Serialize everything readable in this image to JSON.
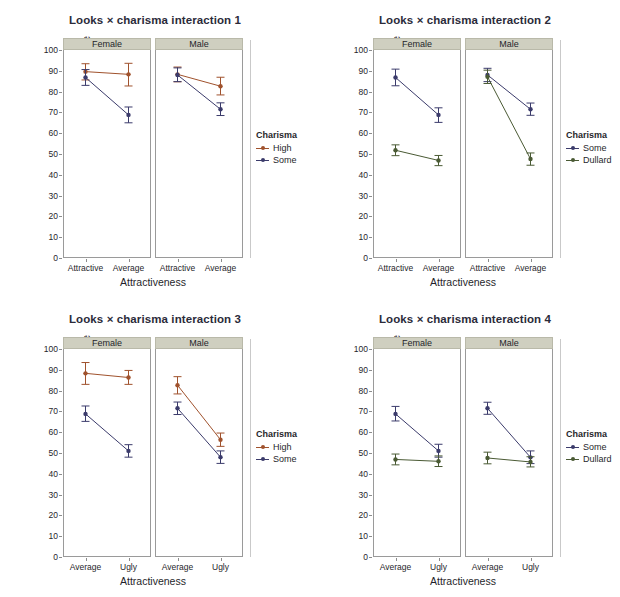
{
  "figure": {
    "ylabel": "Mean Rating of Date",
    "xlabel": "Attractiveness",
    "ylim": [
      0,
      100
    ],
    "yticks": [
      0,
      10,
      20,
      30,
      40,
      50,
      60,
      70,
      80,
      90,
      100
    ],
    "legend_title": "Charisma",
    "colors": {
      "high": "#a0522d",
      "some": "#3b3b6b",
      "dullard": "#4a5a34",
      "strip_bg": "#cfcfc0",
      "panel_border": "#9a9a9a",
      "text": "#1f1f2b"
    }
  },
  "chart_data": [
    {
      "type": "line",
      "title": "Looks × charisma interaction 1",
      "xlabel": "Attractiveness",
      "ylabel": "Mean Rating of Date",
      "ylim": [
        0,
        100
      ],
      "yticks": [
        0,
        10,
        20,
        30,
        40,
        50,
        60,
        70,
        80,
        90,
        100
      ],
      "grid": false,
      "legend_position": "right",
      "legend_title": "Charisma",
      "facets": [
        {
          "label": "Female",
          "categories": [
            "Attractive",
            "Average"
          ],
          "series": [
            {
              "name": "High",
              "color": "#a0522d",
              "values": [
                89.6,
                88.3
              ],
              "err_low": [
                85.6,
                82.7
              ],
              "err_high": [
                93.4,
                93.6
              ]
            },
            {
              "name": "Some",
              "color": "#3b3b6b",
              "values": [
                86.8,
                68.8
              ],
              "err_low": [
                83.0,
                65.0
              ],
              "err_high": [
                90.6,
                72.6
              ]
            }
          ]
        },
        {
          "label": "Male",
          "categories": [
            "Attractive",
            "Average"
          ],
          "series": [
            {
              "name": "High",
              "color": "#a0522d",
              "values": [
                88.3,
                82.6
              ],
              "err_low": [
                84.7,
                78.4
              ],
              "err_high": [
                91.8,
                86.9
              ]
            },
            {
              "name": "Some",
              "color": "#3b3b6b",
              "values": [
                88.0,
                71.5
              ],
              "err_low": [
                84.8,
                68.5
              ],
              "err_high": [
                91.4,
                74.6
              ]
            }
          ]
        }
      ]
    },
    {
      "type": "line",
      "title": "Looks × charisma interaction 2",
      "xlabel": "Attractiveness",
      "ylabel": "Mean Rating of Date",
      "ylim": [
        0,
        100
      ],
      "yticks": [
        0,
        10,
        20,
        30,
        40,
        50,
        60,
        70,
        80,
        90,
        100
      ],
      "grid": false,
      "legend_position": "right",
      "legend_title": "Charisma",
      "facets": [
        {
          "label": "Female",
          "categories": [
            "Attractive",
            "Average"
          ],
          "series": [
            {
              "name": "Some",
              "color": "#3b3b6b",
              "values": [
                86.8,
                68.8
              ],
              "err_low": [
                82.8,
                65.2
              ],
              "err_high": [
                90.8,
                72.2
              ]
            },
            {
              "name": "Dullard",
              "color": "#4a5a34",
              "values": [
                51.8,
                46.9
              ],
              "err_low": [
                49.2,
                44.4
              ],
              "err_high": [
                54.4,
                49.3
              ]
            }
          ]
        },
        {
          "label": "Male",
          "categories": [
            "Attractive",
            "Average"
          ],
          "series": [
            {
              "name": "Some",
              "color": "#3b3b6b",
              "values": [
                88.0,
                71.5
              ],
              "err_low": [
                84.8,
                68.6
              ],
              "err_high": [
                91.2,
                74.5
              ]
            },
            {
              "name": "Dullard",
              "color": "#4a5a34",
              "values": [
                87.1,
                47.6
              ],
              "err_low": [
                83.9,
                44.6
              ],
              "err_high": [
                90.3,
                50.5
              ]
            }
          ]
        }
      ]
    },
    {
      "type": "line",
      "title": "Looks × charisma interaction 3",
      "xlabel": "Attractiveness",
      "ylabel": "Mean Rating of Date",
      "ylim": [
        0,
        100
      ],
      "yticks": [
        0,
        10,
        20,
        30,
        40,
        50,
        60,
        70,
        80,
        90,
        100
      ],
      "grid": false,
      "legend_position": "right",
      "legend_title": "Charisma",
      "facets": [
        {
          "label": "Female",
          "categories": [
            "Average",
            "Ugly"
          ],
          "series": [
            {
              "name": "High",
              "color": "#a0522d",
              "values": [
                88.3,
                86.3
              ],
              "err_low": [
                83.0,
                83.0
              ],
              "err_high": [
                93.5,
                89.7
              ]
            },
            {
              "name": "Some",
              "color": "#3b3b6b",
              "values": [
                68.8,
                51.0
              ],
              "err_low": [
                65.2,
                48.0
              ],
              "err_high": [
                72.6,
                54.0
              ]
            }
          ]
        },
        {
          "label": "Male",
          "categories": [
            "Average",
            "Ugly"
          ],
          "series": [
            {
              "name": "High",
              "color": "#a0522d",
              "values": [
                82.6,
                56.4
              ],
              "err_low": [
                78.4,
                53.2
              ],
              "err_high": [
                86.7,
                59.6
              ]
            },
            {
              "name": "Some",
              "color": "#3b3b6b",
              "values": [
                71.5,
                48.0
              ],
              "err_low": [
                68.5,
                45.0
              ],
              "err_high": [
                74.5,
                51.0
              ]
            }
          ]
        }
      ]
    },
    {
      "type": "line",
      "title": "Looks × charisma interaction 4",
      "xlabel": "Attractiveness",
      "ylabel": "Mean Rating of Date",
      "ylim": [
        0,
        100
      ],
      "yticks": [
        0,
        10,
        20,
        30,
        40,
        50,
        60,
        70,
        80,
        90,
        100
      ],
      "grid": false,
      "legend_position": "right",
      "legend_title": "Charisma",
      "facets": [
        {
          "label": "Female",
          "categories": [
            "Average",
            "Ugly"
          ],
          "series": [
            {
              "name": "Some",
              "color": "#3b3b6b",
              "values": [
                68.8,
                51.0
              ],
              "err_low": [
                65.4,
                48.0
              ],
              "err_high": [
                72.4,
                54.2
              ]
            },
            {
              "name": "Dullard",
              "color": "#4a5a34",
              "values": [
                46.9,
                46.0
              ],
              "err_low": [
                44.3,
                43.5
              ],
              "err_high": [
                49.5,
                48.6
              ]
            }
          ]
        },
        {
          "label": "Male",
          "categories": [
            "Average",
            "Ugly"
          ],
          "series": [
            {
              "name": "Some",
              "color": "#3b3b6b",
              "values": [
                71.5,
                47.9
              ],
              "err_low": [
                68.6,
                44.9
              ],
              "err_high": [
                74.4,
                51.0
              ]
            },
            {
              "name": "Dullard",
              "color": "#4a5a34",
              "values": [
                47.6,
                45.7
              ],
              "err_low": [
                44.8,
                43.3
              ],
              "err_high": [
                50.4,
                48.2
              ]
            }
          ]
        }
      ]
    }
  ]
}
